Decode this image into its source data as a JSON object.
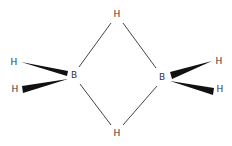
{
  "molecule": {
    "name": "diborane",
    "atoms": {
      "bridge_top": {
        "label": "H",
        "x": 117,
        "y": 17
      },
      "bridge_bottom": {
        "label": "H",
        "x": 117,
        "y": 136
      },
      "boron_left": {
        "label": "B",
        "x": 74,
        "y": 78
      },
      "boron_right": {
        "label": "B",
        "x": 162,
        "y": 80
      },
      "h_left_upper": {
        "label": "H",
        "x": 14,
        "y": 65
      },
      "h_left_lower": {
        "label": "H",
        "x": 15,
        "y": 92
      },
      "h_right_upper": {
        "label": "H",
        "x": 219,
        "y": 64
      },
      "h_right_lower": {
        "label": "H",
        "x": 220,
        "y": 92
      }
    },
    "colors": {
      "text": "#333333",
      "bond": "#444444",
      "wedge": "#111111",
      "background": "#ffffff"
    }
  }
}
